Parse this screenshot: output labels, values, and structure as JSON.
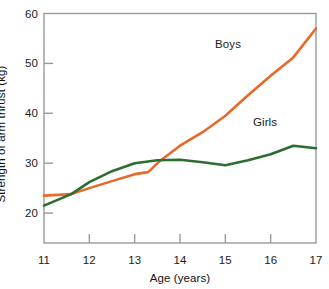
{
  "chart_data": {
    "type": "line",
    "title": "",
    "xlabel": "Age (years)",
    "ylabel": "Strength of arm thrust (kg)",
    "xlim": [
      11,
      17
    ],
    "ylim": [
      14,
      60
    ],
    "xticks": [
      11,
      12,
      13,
      14,
      15,
      16,
      17
    ],
    "yticks": [
      20,
      30,
      40,
      50,
      60
    ],
    "grid": false,
    "legend_position": "inline-annotation",
    "series": [
      {
        "name": "Boys",
        "color": "#E8692A",
        "x": [
          11,
          11.6,
          12,
          12.5,
          13,
          13.3,
          13.55,
          14,
          14.5,
          15,
          15.5,
          16,
          16.5,
          17
        ],
        "values": [
          23.5,
          23.8,
          25,
          26.4,
          27.8,
          28.2,
          30.4,
          33.5,
          36.2,
          39.5,
          43.6,
          47.5,
          51.2,
          57
        ]
      },
      {
        "name": "Girls",
        "color": "#2C6E32",
        "x": [
          11,
          11.6,
          12,
          12.5,
          13,
          13.5,
          14,
          14.5,
          15,
          15.5,
          16,
          16.5,
          17
        ],
        "values": [
          21.5,
          23.8,
          26.2,
          28.4,
          30,
          30.6,
          30.7,
          30.2,
          29.6,
          30.6,
          31.8,
          33.5,
          33
        ]
      }
    ]
  },
  "axes": {
    "y_tick_labels": [
      "60",
      "50",
      "40",
      "30",
      "20"
    ],
    "x_tick_labels": [
      "11",
      "12",
      "13",
      "14",
      "15",
      "16",
      "17"
    ],
    "x_title": "Age (years)",
    "y_title": "Strength of arm thrust (kg)"
  },
  "annotations": {
    "boys_label": "Boys",
    "girls_label": "Girls"
  },
  "colors": {
    "boys": "#E8692A",
    "girls": "#2C6E32",
    "axis": "#9a9a9a",
    "text": "#1a1a1a"
  }
}
